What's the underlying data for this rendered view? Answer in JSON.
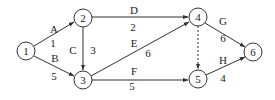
{
  "diagram": {
    "type": "activity-network",
    "nodes": [
      {
        "id": "1",
        "label": "1",
        "x": 26,
        "y": 51
      },
      {
        "id": "2",
        "label": "2",
        "x": 83,
        "y": 18
      },
      {
        "id": "3",
        "label": "3",
        "x": 83,
        "y": 80
      },
      {
        "id": "4",
        "label": "4",
        "x": 198,
        "y": 17
      },
      {
        "id": "5",
        "label": "5",
        "x": 198,
        "y": 79
      },
      {
        "id": "6",
        "label": "6",
        "x": 253,
        "y": 52
      }
    ],
    "edges": [
      {
        "id": "A",
        "from": "1",
        "to": "2",
        "activity": "A",
        "duration": "1",
        "dashed": false
      },
      {
        "id": "B",
        "from": "1",
        "to": "3",
        "activity": "B",
        "duration": "5",
        "dashed": false
      },
      {
        "id": "C",
        "from": "2",
        "to": "3",
        "activity": "C",
        "duration": "3",
        "dashed": false
      },
      {
        "id": "D",
        "from": "2",
        "to": "4",
        "activity": "D",
        "duration": "2",
        "dashed": false
      },
      {
        "id": "E",
        "from": "3",
        "to": "4",
        "activity": "E",
        "duration": "6",
        "dashed": false
      },
      {
        "id": "F",
        "from": "3",
        "to": "5",
        "activity": "F",
        "duration": "5",
        "dashed": false
      },
      {
        "id": "dummy",
        "from": "4",
        "to": "5",
        "activity": "",
        "duration": "",
        "dashed": true
      },
      {
        "id": "G",
        "from": "4",
        "to": "6",
        "activity": "G",
        "duration": "6",
        "dashed": false
      },
      {
        "id": "H",
        "from": "5",
        "to": "6",
        "activity": "H",
        "duration": "4",
        "dashed": false
      }
    ]
  },
  "labels": {
    "node1": "1",
    "node2": "2",
    "node3": "3",
    "node4": "4",
    "node5": "5",
    "node6": "6",
    "A": "A",
    "A_dur": "1",
    "B": "B",
    "B_dur": "5",
    "C": "C",
    "C_dur": "3",
    "D": "D",
    "D_dur": "2",
    "E": "E",
    "E_dur": "6",
    "F": "F",
    "F_dur": "5",
    "G": "G",
    "G_dur": "6",
    "H": "H",
    "H_dur": "4"
  },
  "colors": {
    "stroke": "#333333",
    "text": "#222222",
    "background": "#ffffff"
  }
}
